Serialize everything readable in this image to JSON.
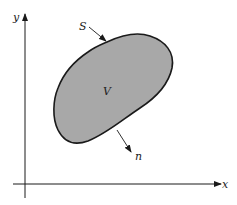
{
  "diagram": {
    "axes": {
      "x_label": "x",
      "y_label": "y"
    },
    "region_label": "V",
    "surface_label": "S",
    "normal_label": "n",
    "colors": {
      "region_fill": "#a8a8a8",
      "stroke": "#1a1a1a",
      "background": "#ffffff"
    }
  }
}
